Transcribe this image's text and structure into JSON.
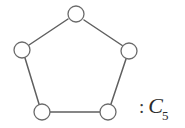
{
  "figure": {
    "kind": "graph-diagram",
    "background_color": "#ffffff",
    "edge_color": "#5f5f5f",
    "vertex_fill_color": "#ffffff",
    "vertex_stroke_color": "#6a6a6a",
    "vertex_radius": 8,
    "vertices": [
      {
        "id": "v1",
        "name": "vertex-top",
        "cx": 76,
        "cy": 14
      },
      {
        "id": "v2",
        "name": "vertex-upper-right",
        "cx": 129,
        "cy": 51
      },
      {
        "id": "v3",
        "name": "vertex-lower-right",
        "cx": 108,
        "cy": 112
      },
      {
        "id": "v4",
        "name": "vertex-lower-left",
        "cx": 42,
        "cy": 112
      },
      {
        "id": "v5",
        "name": "vertex-upper-left",
        "cx": 22,
        "cy": 50
      }
    ],
    "edges": [
      {
        "id": "e1",
        "name": "edge-top-to-upper-right",
        "x1": 84,
        "y1": 20,
        "x2": 123,
        "y2": 46
      },
      {
        "id": "e2",
        "name": "edge-upper-right-to-lower-right",
        "x1": 126,
        "y1": 59,
        "x2": 111,
        "y2": 104
      },
      {
        "id": "e3",
        "name": "edge-lower-right-to-lower-left",
        "x1": 100,
        "y1": 112,
        "x2": 50,
        "y2": 112
      },
      {
        "id": "e4",
        "name": "edge-lower-left-to-upper-left",
        "x1": 39,
        "y1": 104,
        "x2": 25,
        "y2": 58
      },
      {
        "id": "e5",
        "name": "edge-upper-left-to-top",
        "x1": 29,
        "y1": 45,
        "x2": 68,
        "y2": 19
      }
    ]
  },
  "label": {
    "full_text": ": C5",
    "separator": ":",
    "symbol": "C",
    "subscript": "5"
  },
  "chart_data": {
    "type": "diagram",
    "graph_name": "C5",
    "vertex_count": 5,
    "edge_count": 5,
    "adjacency": [
      [
        "v1",
        "v2"
      ],
      [
        "v2",
        "v3"
      ],
      [
        "v3",
        "v4"
      ],
      [
        "v4",
        "v5"
      ],
      [
        "v5",
        "v1"
      ]
    ]
  }
}
